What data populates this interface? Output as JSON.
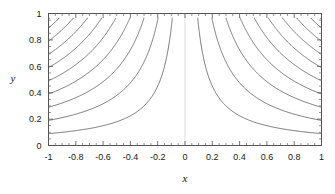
{
  "chart_data": {
    "type": "line",
    "title": "",
    "xlabel": "x",
    "ylabel": "y",
    "xlim": [
      -1,
      1
    ],
    "ylim": [
      0,
      1
    ],
    "grid": false,
    "legend": null,
    "xticks": [
      -1,
      -0.8,
      -0.6,
      -0.4,
      -0.2,
      0,
      0.2,
      0.4,
      0.6,
      0.8,
      1
    ],
    "xticklabels": [
      "-1",
      "-0.8",
      "-0.6",
      "-0.4",
      "-0.2",
      "0",
      "0.2",
      "0.4",
      "0.6",
      "0.8",
      "1"
    ],
    "yticks": [
      0,
      0.2,
      0.4,
      0.6,
      0.8,
      1
    ],
    "yticklabels": [
      "0",
      "0.2",
      "0.4",
      "0.6",
      "0.8",
      "1"
    ],
    "x_minor_tick_step": 0.05,
    "y_minor_tick_step": 0.05,
    "contour_family": "y = c / |x|",
    "contour_levels": [
      0.09,
      0.19,
      0.29,
      0.39,
      0.49,
      0.59,
      0.69,
      0.79,
      0.89,
      0.96
    ],
    "series": [
      {
        "name": "c = 0.09",
        "level": 0.09,
        "branch": "left",
        "x": [
          -1.0,
          -0.9,
          -0.8,
          -0.7,
          -0.6,
          -0.5,
          -0.4,
          -0.3,
          -0.25,
          -0.2,
          -0.15,
          -0.12,
          -0.1,
          -0.095
        ],
        "y": [
          0.09,
          0.1,
          0.1125,
          0.1286,
          0.15,
          0.18,
          0.225,
          0.3,
          0.36,
          0.45,
          0.6,
          0.75,
          0.9,
          0.947
        ]
      },
      {
        "name": "c = 0.09",
        "level": 0.09,
        "branch": "right",
        "x": [
          1.0,
          0.9,
          0.8,
          0.7,
          0.6,
          0.5,
          0.4,
          0.3,
          0.25,
          0.2,
          0.15,
          0.12,
          0.1,
          0.095
        ],
        "y": [
          0.09,
          0.1,
          0.1125,
          0.1286,
          0.15,
          0.18,
          0.225,
          0.3,
          0.36,
          0.45,
          0.6,
          0.75,
          0.9,
          0.947
        ]
      },
      {
        "name": "c = 0.19",
        "level": 0.19,
        "branch": "left",
        "x": [
          -1.0,
          -0.9,
          -0.8,
          -0.7,
          -0.6,
          -0.5,
          -0.45,
          -0.4,
          -0.35,
          -0.3,
          -0.25,
          -0.21,
          -0.2
        ],
        "y": [
          0.19,
          0.211,
          0.2375,
          0.2714,
          0.3167,
          0.38,
          0.422,
          0.475,
          0.543,
          0.633,
          0.76,
          0.905,
          0.95
        ]
      },
      {
        "name": "c = 0.19",
        "level": 0.19,
        "branch": "right",
        "x": [
          1.0,
          0.9,
          0.8,
          0.7,
          0.6,
          0.5,
          0.45,
          0.4,
          0.35,
          0.3,
          0.25,
          0.21,
          0.2
        ],
        "y": [
          0.19,
          0.211,
          0.2375,
          0.2714,
          0.3167,
          0.38,
          0.422,
          0.475,
          0.543,
          0.633,
          0.76,
          0.905,
          0.95
        ]
      },
      {
        "name": "c = 0.29",
        "level": 0.29,
        "branch": "left",
        "x": [
          -1.0,
          -0.9,
          -0.8,
          -0.7,
          -0.6,
          -0.55,
          -0.5,
          -0.45,
          -0.4,
          -0.35,
          -0.32,
          -0.305
        ],
        "y": [
          0.29,
          0.322,
          0.3625,
          0.414,
          0.483,
          0.527,
          0.58,
          0.644,
          0.725,
          0.829,
          0.906,
          0.951
        ]
      },
      {
        "name": "c = 0.29",
        "level": 0.29,
        "branch": "right",
        "x": [
          1.0,
          0.9,
          0.8,
          0.7,
          0.6,
          0.55,
          0.5,
          0.45,
          0.4,
          0.35,
          0.32,
          0.305
        ],
        "y": [
          0.29,
          0.322,
          0.3625,
          0.414,
          0.483,
          0.527,
          0.58,
          0.644,
          0.725,
          0.829,
          0.906,
          0.951
        ]
      },
      {
        "name": "c = 0.39",
        "level": 0.39,
        "branch": "left",
        "x": [
          -1.0,
          -0.9,
          -0.8,
          -0.75,
          -0.7,
          -0.65,
          -0.6,
          -0.55,
          -0.5,
          -0.45,
          -0.42,
          -0.41
        ],
        "y": [
          0.39,
          0.433,
          0.4875,
          0.52,
          0.557,
          0.6,
          0.65,
          0.709,
          0.78,
          0.867,
          0.929,
          0.951
        ]
      },
      {
        "name": "c = 0.39",
        "level": 0.39,
        "branch": "right",
        "x": [
          1.0,
          0.9,
          0.8,
          0.75,
          0.7,
          0.65,
          0.6,
          0.55,
          0.5,
          0.45,
          0.42,
          0.41
        ],
        "y": [
          0.39,
          0.433,
          0.4875,
          0.52,
          0.557,
          0.6,
          0.65,
          0.709,
          0.78,
          0.867,
          0.929,
          0.951
        ]
      },
      {
        "name": "c = 0.49",
        "level": 0.49,
        "branch": "left",
        "x": [
          -1.0,
          -0.95,
          -0.9,
          -0.85,
          -0.8,
          -0.75,
          -0.7,
          -0.65,
          -0.6,
          -0.55,
          -0.52,
          -0.515
        ],
        "y": [
          0.49,
          0.516,
          0.544,
          0.576,
          0.6125,
          0.653,
          0.7,
          0.754,
          0.817,
          0.891,
          0.942,
          0.951
        ]
      },
      {
        "name": "c = 0.49",
        "level": 0.49,
        "branch": "right",
        "x": [
          1.0,
          0.95,
          0.9,
          0.85,
          0.8,
          0.75,
          0.7,
          0.65,
          0.6,
          0.55,
          0.52,
          0.515
        ],
        "y": [
          0.49,
          0.516,
          0.544,
          0.576,
          0.6125,
          0.653,
          0.7,
          0.754,
          0.817,
          0.891,
          0.942,
          0.951
        ]
      },
      {
        "name": "c = 0.59",
        "level": 0.59,
        "branch": "left",
        "x": [
          -1.0,
          -0.95,
          -0.9,
          -0.85,
          -0.8,
          -0.75,
          -0.7,
          -0.66,
          -0.63,
          -0.62
        ],
        "y": [
          0.59,
          0.621,
          0.656,
          0.694,
          0.7375,
          0.787,
          0.843,
          0.894,
          0.937,
          0.952
        ]
      },
      {
        "name": "c = 0.59",
        "level": 0.59,
        "branch": "right",
        "x": [
          1.0,
          0.95,
          0.9,
          0.85,
          0.8,
          0.75,
          0.7,
          0.66,
          0.63,
          0.62
        ],
        "y": [
          0.59,
          0.621,
          0.656,
          0.694,
          0.7375,
          0.787,
          0.843,
          0.894,
          0.937,
          0.952
        ]
      },
      {
        "name": "c = 0.69",
        "level": 0.69,
        "branch": "left",
        "x": [
          -1.0,
          -0.95,
          -0.9,
          -0.87,
          -0.84,
          -0.8,
          -0.77,
          -0.74,
          -0.725
        ],
        "y": [
          0.69,
          0.726,
          0.767,
          0.793,
          0.821,
          0.8625,
          0.896,
          0.932,
          0.952
        ]
      },
      {
        "name": "c = 0.69",
        "level": 0.69,
        "branch": "right",
        "x": [
          1.0,
          0.95,
          0.9,
          0.87,
          0.84,
          0.8,
          0.77,
          0.74,
          0.725
        ],
        "y": [
          0.69,
          0.726,
          0.767,
          0.793,
          0.821,
          0.8625,
          0.896,
          0.932,
          0.952
        ]
      },
      {
        "name": "c = 0.79",
        "level": 0.79,
        "branch": "left",
        "x": [
          -1.0,
          -0.97,
          -0.94,
          -0.91,
          -0.88,
          -0.86,
          -0.84,
          -0.83
        ],
        "y": [
          0.79,
          0.814,
          0.84,
          0.868,
          0.898,
          0.919,
          0.94,
          0.952
        ]
      },
      {
        "name": "c = 0.79",
        "level": 0.79,
        "branch": "right",
        "x": [
          1.0,
          0.97,
          0.94,
          0.91,
          0.88,
          0.86,
          0.84,
          0.83
        ],
        "y": [
          0.79,
          0.814,
          0.84,
          0.868,
          0.898,
          0.919,
          0.94,
          0.952
        ]
      },
      {
        "name": "c = 0.89",
        "level": 0.89,
        "branch": "left",
        "x": [
          -1.0,
          -0.98,
          -0.96,
          -0.95,
          -0.94,
          -0.935
        ],
        "y": [
          0.89,
          0.908,
          0.927,
          0.937,
          0.947,
          0.952
        ]
      },
      {
        "name": "c = 0.89",
        "level": 0.89,
        "branch": "right",
        "x": [
          1.0,
          0.98,
          0.96,
          0.95,
          0.94,
          0.935
        ],
        "y": [
          0.89,
          0.908,
          0.927,
          0.937,
          0.947,
          0.952
        ]
      },
      {
        "name": "c = 0.96",
        "level": 0.96,
        "branch": "left",
        "x": [
          -1.0,
          -0.995,
          -0.99
        ],
        "y": [
          0.96,
          0.965,
          0.97
        ]
      },
      {
        "name": "c = 0.96",
        "level": 0.96,
        "branch": "right",
        "x": [
          1.0,
          0.995,
          0.99
        ],
        "y": [
          0.96,
          0.965,
          0.97
        ]
      }
    ],
    "asymptote_line": {
      "x": 0,
      "label": "x = 0"
    }
  },
  "axes": {
    "x_title": "x",
    "y_title": "y"
  },
  "colors": {
    "background": "#ffffff",
    "contour_line": "#4a4a4a",
    "frame": "#555555",
    "text": "#1a1a1a",
    "asymptote": "#cccccc"
  }
}
